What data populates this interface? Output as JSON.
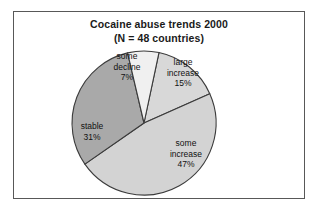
{
  "figure": {
    "background": "#ffffff",
    "frame_color": "#585858"
  },
  "chart_data": {
    "type": "pie",
    "title": "Cocaine abuse trends 2000",
    "subtitle": "(N = 48 countries)",
    "xlabel": "",
    "ylabel": "",
    "legend": "none",
    "grid": false,
    "total_label": "N = 48 countries",
    "total": 48,
    "units": "percent",
    "categories": [
      "large increase",
      "some increase",
      "stable",
      "some decline"
    ],
    "values": [
      15,
      47,
      31,
      7
    ],
    "start_angle_deg": -78,
    "direction": "clockwise",
    "slices": [
      {
        "name": "large increase",
        "label_line1": "large",
        "label_line2": "increase",
        "value_label": "15%",
        "value": 15,
        "color": "#d8d8d8"
      },
      {
        "name": "some increase",
        "label_line1": "some",
        "label_line2": "increase",
        "value_label": "47%",
        "value": 47,
        "color": "#d3d3d3"
      },
      {
        "name": "stable",
        "label_line1": "stable",
        "label_line2": "",
        "value_label": "31%",
        "value": 31,
        "color": "#a9a9a9"
      },
      {
        "name": "some decline",
        "label_line1": "some",
        "label_line2": "decline",
        "value_label": "7%",
        "value": 7,
        "color": "#f0f0f0"
      }
    ]
  }
}
